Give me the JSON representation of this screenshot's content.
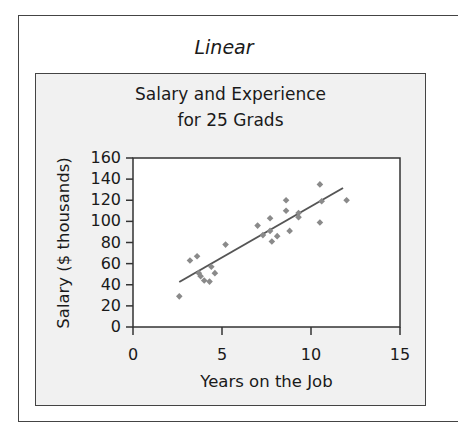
{
  "panel_title": "Linear",
  "chart_data": {
    "type": "scatter",
    "title": "Salary and Experience for 25 Grads",
    "title_lines": [
      "Salary and Experience",
      "for 25 Grads"
    ],
    "xlabel": "Years on the Job",
    "ylabel": "Salary ($ thousands)",
    "xlim": [
      0,
      15
    ],
    "ylim": [
      0,
      160
    ],
    "xticks": [
      0,
      5,
      10,
      15
    ],
    "yticks": [
      0,
      20,
      40,
      60,
      80,
      100,
      120,
      140,
      160
    ],
    "grid": false,
    "legend": null,
    "marker": "diamond",
    "colors": {
      "points": "#8a8a8a",
      "trendline": "#555555",
      "panel_bg": "#f1f1f1",
      "plot_bg": "#ffffff"
    },
    "points": [
      {
        "x": 2.6,
        "y": 29
      },
      {
        "x": 3.2,
        "y": 63
      },
      {
        "x": 3.6,
        "y": 67
      },
      {
        "x": 3.7,
        "y": 51
      },
      {
        "x": 3.8,
        "y": 48
      },
      {
        "x": 4.0,
        "y": 44
      },
      {
        "x": 4.3,
        "y": 43
      },
      {
        "x": 4.4,
        "y": 57
      },
      {
        "x": 4.6,
        "y": 51
      },
      {
        "x": 5.2,
        "y": 78
      },
      {
        "x": 7.0,
        "y": 96
      },
      {
        "x": 7.3,
        "y": 87
      },
      {
        "x": 7.7,
        "y": 103
      },
      {
        "x": 7.7,
        "y": 91
      },
      {
        "x": 7.8,
        "y": 81
      },
      {
        "x": 8.1,
        "y": 86
      },
      {
        "x": 8.6,
        "y": 120
      },
      {
        "x": 8.6,
        "y": 110
      },
      {
        "x": 8.8,
        "y": 91
      },
      {
        "x": 9.3,
        "y": 108
      },
      {
        "x": 9.3,
        "y": 104
      },
      {
        "x": 10.5,
        "y": 99
      },
      {
        "x": 10.6,
        "y": 119
      },
      {
        "x": 10.5,
        "y": 135
      },
      {
        "x": 12.0,
        "y": 120
      }
    ],
    "trendline": {
      "type": "linear",
      "x": [
        2.6,
        11.8
      ],
      "y": [
        42.6,
        131.6
      ]
    }
  }
}
